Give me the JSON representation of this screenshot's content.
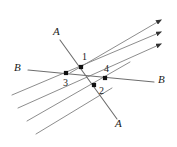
{
  "figure": {
    "type": "geometry-diagram",
    "background_color": "#ffffff",
    "line_color": "#808080",
    "transversal_color": "#6e6e6e",
    "point_color": "#111111",
    "text_color": "#1a1a1a",
    "labels": {
      "transversal_a_top": "A",
      "transversal_a_bottom": "A",
      "transversal_b_left": "B",
      "transversal_b_right": "B",
      "point_1": "1",
      "point_2": "2",
      "point_3": "3",
      "point_4": "4"
    },
    "parallel_lines": [
      {
        "name": "parallel-line-1",
        "x1": 70,
        "y1": 73,
        "x2": 161,
        "y2": 20,
        "arrow": true
      },
      {
        "name": "parallel-line-2",
        "x1": 12,
        "y1": 95,
        "x2": 161,
        "y2": 32,
        "arrow": true
      },
      {
        "name": "parallel-line-3",
        "x1": 18,
        "y1": 108,
        "x2": 161,
        "y2": 44,
        "arrow": true
      },
      {
        "name": "parallel-line-4",
        "x1": 27,
        "y1": 121,
        "x2": 130,
        "y2": 62,
        "arrow": false
      },
      {
        "name": "parallel-line-5",
        "x1": 36,
        "y1": 134,
        "x2": 112,
        "y2": 88,
        "arrow": false
      }
    ],
    "transversals": [
      {
        "name": "transversal-a",
        "x1": 60,
        "y1": 40,
        "x2": 117,
        "y2": 119
      },
      {
        "name": "transversal-b",
        "x1": 28,
        "y1": 70,
        "x2": 154,
        "y2": 82
      }
    ],
    "points": [
      {
        "name": "point-1",
        "label": "1",
        "x": 81,
        "y": 67,
        "label_x": 82,
        "label_y": 52
      },
      {
        "name": "point-2",
        "label": "2",
        "x": 94,
        "y": 85,
        "label_x": 99,
        "label_y": 86
      },
      {
        "name": "point-3",
        "label": "3",
        "x": 66,
        "y": 73,
        "label_x": 63,
        "label_y": 78
      },
      {
        "name": "point-4",
        "label": "4",
        "x": 105,
        "y": 78,
        "label_x": 104,
        "label_y": 64
      }
    ],
    "letter_labels": [
      {
        "name": "label-a-top",
        "text": "A",
        "x": 53,
        "y": 26
      },
      {
        "name": "label-a-bottom",
        "text": "A",
        "x": 115,
        "y": 118
      },
      {
        "name": "label-b-left",
        "text": "B",
        "x": 14,
        "y": 62
      },
      {
        "name": "label-b-right",
        "text": "B",
        "x": 158,
        "y": 74
      }
    ]
  }
}
